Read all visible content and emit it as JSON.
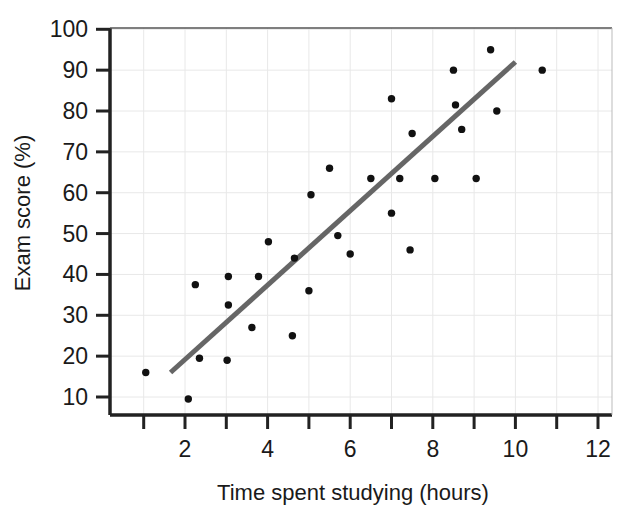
{
  "chart_data": {
    "type": "scatter",
    "title": "",
    "xlabel": "Time spent studying (hours)",
    "ylabel": "Exam score (%)",
    "xlim": [
      0,
      12
    ],
    "ylim": [
      0,
      100
    ],
    "xticks": [
      2,
      4,
      6,
      8,
      10,
      12
    ],
    "xticks_all": [
      1,
      2,
      3,
      4,
      5,
      6,
      7,
      8,
      9,
      10,
      11,
      12
    ],
    "yticks": [
      10,
      20,
      30,
      40,
      50,
      60,
      70,
      80,
      90,
      100
    ],
    "grid": true,
    "grid_color": "#e8e8e8",
    "legend": "none",
    "marker_color": "#111111",
    "marker_size": 5,
    "points": [
      {
        "x": 1.05,
        "y": 16
      },
      {
        "x": 2.08,
        "y": 9.5
      },
      {
        "x": 2.25,
        "y": 37.5
      },
      {
        "x": 2.35,
        "y": 19.5
      },
      {
        "x": 3.02,
        "y": 19
      },
      {
        "x": 3.05,
        "y": 32.5
      },
      {
        "x": 3.05,
        "y": 39.5
      },
      {
        "x": 3.62,
        "y": 27
      },
      {
        "x": 3.78,
        "y": 39.5
      },
      {
        "x": 4.02,
        "y": 48
      },
      {
        "x": 4.6,
        "y": 25
      },
      {
        "x": 4.65,
        "y": 44
      },
      {
        "x": 5.0,
        "y": 36
      },
      {
        "x": 5.05,
        "y": 59.5
      },
      {
        "x": 5.5,
        "y": 66
      },
      {
        "x": 5.7,
        "y": 49.5
      },
      {
        "x": 6.0,
        "y": 45
      },
      {
        "x": 6.5,
        "y": 63.5
      },
      {
        "x": 7.0,
        "y": 55
      },
      {
        "x": 7.0,
        "y": 83
      },
      {
        "x": 7.2,
        "y": 63.5
      },
      {
        "x": 7.45,
        "y": 46
      },
      {
        "x": 7.5,
        "y": 74.5
      },
      {
        "x": 8.05,
        "y": 63.5
      },
      {
        "x": 8.5,
        "y": 90
      },
      {
        "x": 8.55,
        "y": 81.5
      },
      {
        "x": 8.7,
        "y": 75.5
      },
      {
        "x": 9.05,
        "y": 63.5
      },
      {
        "x": 9.4,
        "y": 95
      },
      {
        "x": 9.55,
        "y": 80
      },
      {
        "x": 10.65,
        "y": 90
      }
    ],
    "trend_line": {
      "color": "#666666",
      "width": 5,
      "x0": 1.65,
      "y0": 16,
      "x1": 10.0,
      "y1": 92
    }
  }
}
